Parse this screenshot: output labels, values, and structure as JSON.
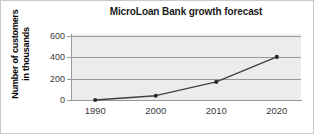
{
  "chart_data": {
    "type": "line",
    "title": "MicroLoan Bank growth forecast",
    "xlabel": "",
    "ylabel": "Number of customers in thousands",
    "ylabel_lines": [
      "Number of customers",
      "in thousands"
    ],
    "categories": [
      "1990",
      "2000",
      "2010",
      "2020"
    ],
    "x": [
      1990,
      2000,
      2010,
      2020
    ],
    "values": [
      0,
      40,
      170,
      405
    ],
    "series": [
      {
        "name": "Number of customers in thousands",
        "values": [
          0,
          40,
          170,
          405
        ]
      }
    ],
    "ylim": [
      0,
      620
    ],
    "xlim": [
      1986,
      2024
    ],
    "yticks": [
      0,
      200,
      400,
      600
    ],
    "ytick_labels": [
      "0",
      "200",
      "400",
      "600"
    ],
    "xtick_labels": [
      "1990",
      "2000",
      "2010",
      "2020"
    ],
    "grid": "horizontal",
    "legend": "none",
    "markers": "filled-circle",
    "colors": {
      "line": "#3f3f3f",
      "marker": "#2b2b2b",
      "plot_background": "#ececec",
      "gridline": "#9a9a9a",
      "axis": "#9a9a9a",
      "title_text": "#1b1b1b",
      "tick_text": "#3a3a3a",
      "axis_label_text": "#000000",
      "figure_background": "#ffffff",
      "figure_border": "#c9c9c9"
    }
  }
}
